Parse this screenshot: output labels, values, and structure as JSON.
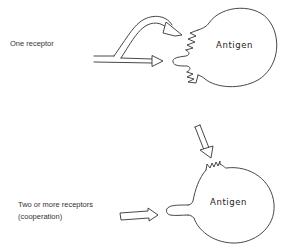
{
  "figure": {
    "panels": [
      {
        "id": "one-receptor",
        "label": "One receptor",
        "antigen_label": "Antigen"
      },
      {
        "id": "multiple-receptors",
        "label_line1": "Two or more receptors",
        "label_line2": "(cooperation)",
        "antigen_label": "Antigen"
      }
    ],
    "colors": {
      "line": "#333333",
      "background": "#ffffff"
    }
  }
}
